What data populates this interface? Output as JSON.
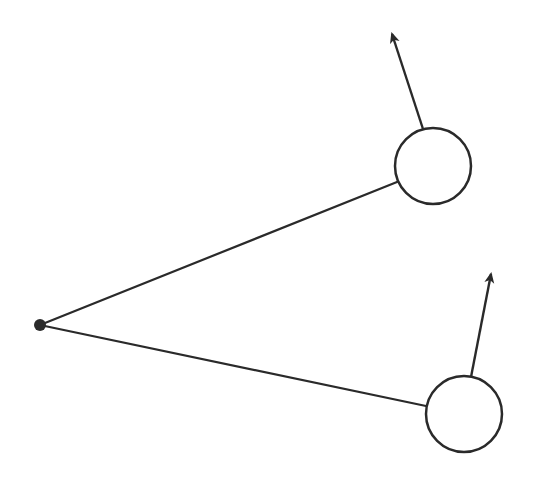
{
  "diagram": {
    "type": "vector-diagram",
    "stroke_color": "#2a2a2a",
    "background": "#ffffff",
    "pivot": {
      "cx": 40,
      "cy": 325,
      "r": 6
    },
    "bodies": [
      {
        "id": "upper",
        "circle": {
          "cx": 433,
          "cy": 166,
          "r": 38
        },
        "rod": {
          "x1": 40,
          "y1": 325,
          "x2": 397,
          "y2": 182
        },
        "arrow": {
          "x1": 423,
          "y1": 129,
          "x2": 392,
          "y2": 34
        }
      },
      {
        "id": "lower",
        "circle": {
          "cx": 464,
          "cy": 414,
          "r": 38
        },
        "rod": {
          "x1": 40,
          "y1": 325,
          "x2": 426,
          "y2": 406
        },
        "arrow": {
          "x1": 471,
          "y1": 377,
          "x2": 491,
          "y2": 274
        }
      }
    ]
  }
}
